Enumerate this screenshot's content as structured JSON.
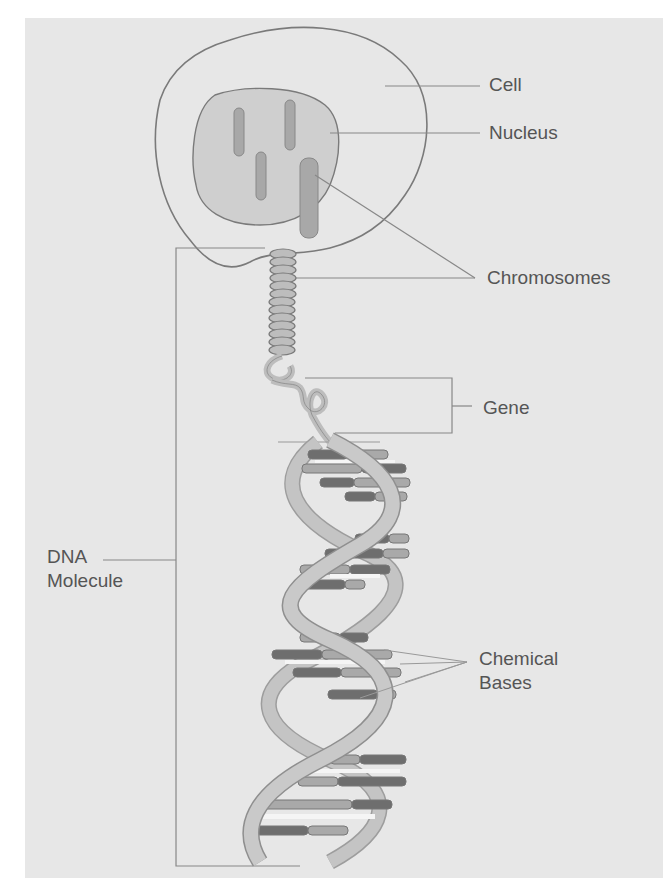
{
  "diagram": {
    "colors": {
      "background": "#e7e7e7",
      "outline": "#7a7a7a",
      "nucleus_fill": "#cfcfcf",
      "chromosome_fill": "#a8a8a8",
      "backbone_fill": "#bdbdbd",
      "base_light": "#a9a9a9",
      "base_dark": "#6e6e6e",
      "label_text": "#555555"
    },
    "labels": {
      "cell": "Cell",
      "nucleus": "Nucleus",
      "chromosomes": "Chromosomes",
      "gene": "Gene",
      "dna_line1": "DNA",
      "dna_line2": "Molecule",
      "bases_line1": "Chemical",
      "bases_line2": "Bases"
    },
    "parts": [
      {
        "name": "cell",
        "description": "outer cell membrane outline"
      },
      {
        "name": "nucleus",
        "description": "shaded nucleus with 4 chromosomes"
      },
      {
        "name": "chromosomes",
        "description": "coiled chromatin strand emerging from nucleus"
      },
      {
        "name": "gene",
        "description": "bracketed segment of uncoiled strand"
      },
      {
        "name": "dna-molecule",
        "description": "double helix bracketed on the left"
      },
      {
        "name": "chemical-bases",
        "description": "base-pair rungs of the helix"
      }
    ]
  }
}
